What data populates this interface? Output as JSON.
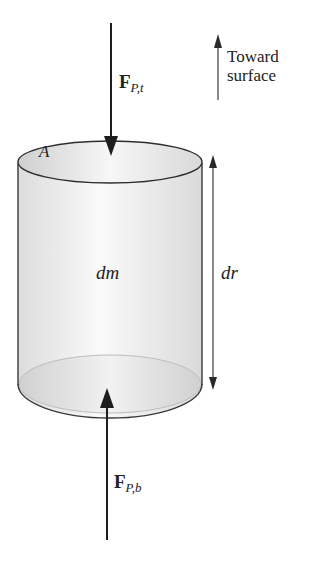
{
  "diagram": {
    "type": "free-body diagram of cylindrical mass element",
    "labels": {
      "area": "A",
      "mass": "dm",
      "height": "dr",
      "top_force_symbol": "F",
      "top_force_subscript": "P,t",
      "bottom_force_symbol": "F",
      "bottom_force_subscript": "P,b",
      "direction_line1": "Toward",
      "direction_line2": "surface"
    },
    "colors": {
      "stroke": "#2a2a2a",
      "fill_light": "#f4f4f4",
      "fill_shade": "#d6d6d6"
    }
  }
}
